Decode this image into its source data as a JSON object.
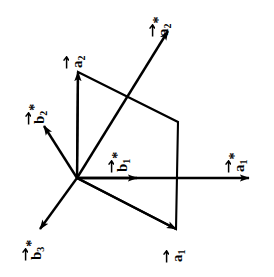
{
  "figure": {
    "background_color": "#ffffff",
    "stroke_color": "#000000",
    "width": 274,
    "height": 277,
    "origin": {
      "x": 77,
      "y": 178
    }
  },
  "vectors": [
    {
      "id": "a2",
      "label_base": "a",
      "label_sub": "2",
      "label_star": "",
      "label_text": "a2",
      "tip": {
        "x": 78,
        "y": 72
      },
      "has_arrowhead": true,
      "label_pos": {
        "x": 70,
        "y": 68
      }
    },
    {
      "id": "a2star",
      "label_base": "a",
      "label_sub": "2",
      "label_star": "*",
      "label_text": "a2*",
      "tip": {
        "x": 168,
        "y": 31
      },
      "has_arrowhead": true,
      "label_pos": {
        "x": 152,
        "y": 36
      }
    },
    {
      "id": "b2star",
      "label_base": "b",
      "label_sub": "2",
      "label_star": "*",
      "label_text": "b2*",
      "tip": {
        "x": 44,
        "y": 126
      },
      "has_arrowhead": true,
      "label_pos": {
        "x": 28,
        "y": 124
      }
    },
    {
      "id": "b1star",
      "label_base": "b",
      "label_sub": "1",
      "label_star": "*",
      "label_text": "b1*",
      "tip": {
        "x": 137,
        "y": 178
      },
      "has_arrowhead": true,
      "label_pos": {
        "x": 111,
        "y": 172
      }
    },
    {
      "id": "a1star",
      "label_base": "a",
      "label_sub": "1",
      "label_star": "*",
      "label_text": "a1*",
      "tip": {
        "x": 249,
        "y": 178
      },
      "has_arrowhead": true,
      "label_pos": {
        "x": 228,
        "y": 172
      }
    },
    {
      "id": "b3star",
      "label_base": "b",
      "label_sub": "3",
      "label_star": "*",
      "label_text": "b3*",
      "tip": {
        "x": 40,
        "y": 229
      },
      "has_arrowhead": true,
      "label_pos": {
        "x": 25,
        "y": 260
      }
    },
    {
      "id": "a1",
      "label_base": "a",
      "label_sub": "1",
      "label_star": "",
      "label_text": "a1",
      "tip": {
        "x": 176,
        "y": 229
      },
      "has_arrowhead": true,
      "label_pos": {
        "x": 170,
        "y": 262
      }
    }
  ],
  "parallelogram": {
    "id": "unit-cell-parallelogram",
    "points": [
      {
        "x": 77,
        "y": 178
      },
      {
        "x": 78,
        "y": 72
      },
      {
        "x": 178,
        "y": 122
      },
      {
        "x": 176,
        "y": 229
      }
    ],
    "closed": true
  }
}
